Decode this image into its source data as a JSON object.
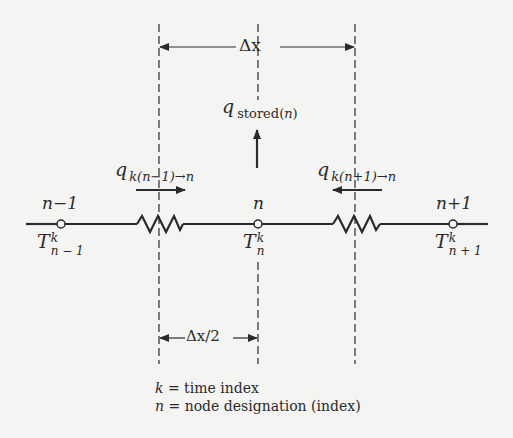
{
  "diagram": {
    "dimension_top": {
      "label": "Δx"
    },
    "dimension_bottom": {
      "label": "Δx/2"
    },
    "stored_heat": {
      "symbol": "q",
      "subscript": "stored",
      "subscript_index": "n"
    },
    "flow_left": {
      "symbol": "q",
      "subscript": "k",
      "subscript_rest": "(n−1)→n",
      "direction": "right"
    },
    "flow_right": {
      "symbol": "q",
      "subscript": "k",
      "subscript_rest": "(n+1)→n",
      "direction": "left"
    },
    "nodes": [
      {
        "index_label": "n−1",
        "temp_symbol": "T",
        "temp_sup": "k",
        "temp_sub": "n − 1"
      },
      {
        "index_label": "n",
        "temp_symbol": "T",
        "temp_sup": "k",
        "temp_sub": "n"
      },
      {
        "index_label": "n+1",
        "temp_symbol": "T",
        "temp_sup": "k",
        "temp_sub": "n + 1"
      }
    ],
    "legend": [
      {
        "symbol": "k",
        "text": "= time index"
      },
      {
        "symbol": "n",
        "text": "= node designation (index)"
      }
    ],
    "colors": {
      "ink": "#2a2a2a",
      "background": "#f4f4f2"
    }
  }
}
